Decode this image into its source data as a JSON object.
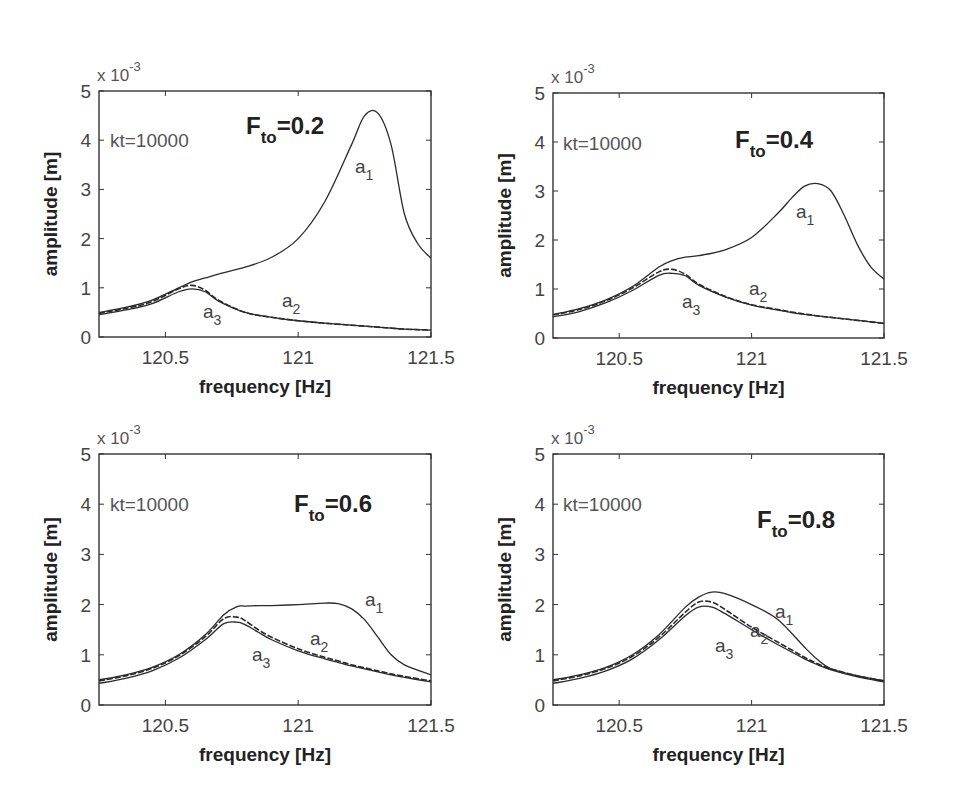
{
  "figure": {
    "layout": "2x2 grid of subplots",
    "panels": [
      {
        "id": "p1",
        "title": "F_to=0.2",
        "ft_main": "F",
        "ft_sub": "to",
        "ft_value": "=0.2",
        "annotation": "kt=10000",
        "exponent_label": "x 10",
        "exponent_power": "-3",
        "xlabel": "frequency  [Hz]",
        "ylabel": "amplitude [m]",
        "frame": {
          "left": 99,
          "top": 91,
          "right": 431,
          "bottom": 337
        },
        "ft_pos": [
          246,
          134
        ],
        "kt_pos": [
          110,
          147
        ],
        "labels": [
          {
            "base": "a",
            "sub": "1",
            "x": 355,
            "y": 173
          },
          {
            "base": "a",
            "sub": "2",
            "x": 282,
            "y": 307
          },
          {
            "base": "a",
            "sub": "3",
            "x": 203,
            "y": 318
          }
        ]
      },
      {
        "id": "p2",
        "title": "F_to=0.4",
        "ft_main": "F",
        "ft_sub": "to",
        "ft_value": "=0.4",
        "annotation": "kt=10000",
        "exponent_label": "x 10",
        "exponent_power": "-3",
        "xlabel": "frequency  [Hz]",
        "ylabel": "amplitude [m]",
        "frame": {
          "left": 553,
          "top": 93,
          "right": 884,
          "bottom": 338
        },
        "ft_pos": [
          735,
          148
        ],
        "kt_pos": [
          563,
          150
        ],
        "labels": [
          {
            "base": "a",
            "sub": "1",
            "x": 796,
            "y": 218
          },
          {
            "base": "a",
            "sub": "2",
            "x": 749,
            "y": 295
          },
          {
            "base": "a",
            "sub": "3",
            "x": 682,
            "y": 308
          }
        ]
      },
      {
        "id": "p3",
        "title": "F_to=0.6",
        "ft_main": "F",
        "ft_sub": "to",
        "ft_value": "=0.6",
        "annotation": "kt=10000",
        "exponent_label": "x 10",
        "exponent_power": "-3",
        "xlabel": "frequency  [Hz]",
        "ylabel": "amplitude [m]",
        "frame": {
          "left": 99,
          "top": 454,
          "right": 431,
          "bottom": 705
        },
        "ft_pos": [
          294,
          512
        ],
        "kt_pos": [
          110,
          511
        ],
        "labels": [
          {
            "base": "a",
            "sub": "1",
            "x": 365,
            "y": 606
          },
          {
            "base": "a",
            "sub": "2",
            "x": 310,
            "y": 645
          },
          {
            "base": "a",
            "sub": "3",
            "x": 252,
            "y": 661
          }
        ]
      },
      {
        "id": "p4",
        "title": "F_to=0.8",
        "ft_main": "F",
        "ft_sub": "to",
        "ft_value": "=0.8",
        "annotation": "kt=10000",
        "exponent_label": "x 10",
        "exponent_power": "-3",
        "xlabel": "frequency  [Hz]",
        "ylabel": "amplitude [m]",
        "frame": {
          "left": 553,
          "top": 454,
          "right": 884,
          "bottom": 705
        },
        "ft_pos": [
          757,
          528
        ],
        "kt_pos": [
          563,
          511
        ],
        "labels": [
          {
            "base": "a",
            "sub": "1",
            "x": 775,
            "y": 618
          },
          {
            "base": "a",
            "sub": "2",
            "x": 750,
            "y": 637
          },
          {
            "base": "a",
            "sub": "3",
            "x": 715,
            "y": 652
          }
        ]
      }
    ]
  },
  "chart_data": [
    {
      "type": "line",
      "title": "F_to=0.2",
      "annotation": "kt=10000",
      "xlabel": "frequency [Hz]",
      "ylabel": "amplitude [m]",
      "y_scale": "x 10^-3",
      "xlim": [
        120.25,
        121.5
      ],
      "ylim": [
        0,
        5
      ],
      "xticks": [
        120.5,
        121,
        121.5
      ],
      "yticks": [
        0,
        1,
        2,
        3,
        4,
        5
      ],
      "grid": false,
      "x": [
        120.25,
        120.35,
        120.45,
        120.55,
        120.6,
        120.65,
        120.7,
        120.8,
        120.9,
        121.0,
        121.1,
        121.2,
        121.25,
        121.3,
        121.35,
        121.4,
        121.45,
        121.5
      ],
      "series": [
        {
          "name": "a1",
          "style": "solid",
          "values": [
            0.5,
            0.6,
            0.75,
            1.0,
            1.12,
            1.2,
            1.28,
            1.42,
            1.62,
            2.0,
            2.75,
            3.9,
            4.5,
            4.55,
            3.9,
            2.5,
            1.9,
            1.6
          ]
        },
        {
          "name": "a2",
          "style": "dashed",
          "values": [
            0.48,
            0.58,
            0.72,
            0.98,
            1.05,
            0.95,
            0.75,
            0.5,
            0.4,
            0.33,
            0.28,
            0.24,
            0.22,
            0.2,
            0.18,
            0.16,
            0.15,
            0.14
          ]
        },
        {
          "name": "a3",
          "style": "solid",
          "values": [
            0.45,
            0.55,
            0.68,
            0.92,
            0.98,
            0.92,
            0.73,
            0.5,
            0.4,
            0.33,
            0.28,
            0.24,
            0.22,
            0.2,
            0.18,
            0.16,
            0.15,
            0.14
          ]
        }
      ]
    },
    {
      "type": "line",
      "title": "F_to=0.4",
      "annotation": "kt=10000",
      "xlabel": "frequency [Hz]",
      "ylabel": "amplitude [m]",
      "y_scale": "x 10^-3",
      "xlim": [
        120.25,
        121.5
      ],
      "ylim": [
        0,
        5
      ],
      "xticks": [
        120.5,
        121,
        121.5
      ],
      "yticks": [
        0,
        1,
        2,
        3,
        4,
        5
      ],
      "grid": false,
      "x": [
        120.25,
        120.35,
        120.45,
        120.55,
        120.65,
        120.7,
        120.75,
        120.8,
        120.9,
        121.0,
        121.1,
        121.15,
        121.2,
        121.25,
        121.3,
        121.35,
        121.4,
        121.45,
        121.5
      ],
      "series": [
        {
          "name": "a1",
          "style": "solid",
          "values": [
            0.48,
            0.6,
            0.78,
            1.05,
            1.45,
            1.58,
            1.65,
            1.68,
            1.8,
            2.05,
            2.55,
            2.85,
            3.1,
            3.15,
            3.0,
            2.5,
            1.9,
            1.45,
            1.2
          ]
        },
        {
          "name": "a2",
          "style": "dashed",
          "values": [
            0.47,
            0.58,
            0.76,
            1.02,
            1.35,
            1.4,
            1.3,
            1.1,
            0.85,
            0.68,
            0.58,
            0.53,
            0.49,
            0.45,
            0.42,
            0.39,
            0.36,
            0.33,
            0.3
          ]
        },
        {
          "name": "a3",
          "style": "solid",
          "values": [
            0.43,
            0.54,
            0.72,
            0.97,
            1.28,
            1.32,
            1.27,
            1.08,
            0.84,
            0.67,
            0.57,
            0.52,
            0.48,
            0.45,
            0.42,
            0.39,
            0.36,
            0.33,
            0.3
          ]
        }
      ]
    },
    {
      "type": "line",
      "title": "F_to=0.6",
      "annotation": "kt=10000",
      "xlabel": "frequency [Hz]",
      "ylabel": "amplitude [m]",
      "y_scale": "x 10^-3",
      "xlim": [
        120.25,
        121.5
      ],
      "ylim": [
        0,
        5
      ],
      "xticks": [
        120.5,
        121,
        121.5
      ],
      "yticks": [
        0,
        1,
        2,
        3,
        4,
        5
      ],
      "grid": false,
      "x": [
        120.25,
        120.35,
        120.45,
        120.55,
        120.65,
        120.72,
        120.77,
        120.8,
        120.85,
        120.9,
        121.0,
        121.1,
        121.15,
        121.2,
        121.25,
        121.3,
        121.35,
        121.4,
        121.5
      ],
      "series": [
        {
          "name": "a1",
          "style": "solid",
          "values": [
            0.5,
            0.6,
            0.75,
            1.0,
            1.4,
            1.8,
            1.96,
            1.97,
            1.98,
            1.98,
            2.0,
            2.03,
            2.02,
            1.92,
            1.7,
            1.35,
            1.0,
            0.8,
            0.6
          ]
        },
        {
          "name": "a2",
          "style": "dashed",
          "values": [
            0.48,
            0.58,
            0.73,
            0.98,
            1.36,
            1.72,
            1.75,
            1.68,
            1.5,
            1.35,
            1.12,
            0.95,
            0.88,
            0.8,
            0.74,
            0.68,
            0.62,
            0.57,
            0.48
          ]
        },
        {
          "name": "a3",
          "style": "solid",
          "values": [
            0.43,
            0.53,
            0.68,
            0.93,
            1.3,
            1.62,
            1.65,
            1.6,
            1.45,
            1.3,
            1.08,
            0.92,
            0.85,
            0.78,
            0.72,
            0.66,
            0.6,
            0.55,
            0.46
          ]
        }
      ]
    },
    {
      "type": "line",
      "title": "F_to=0.8",
      "annotation": "kt=10000",
      "xlabel": "frequency [Hz]",
      "ylabel": "amplitude [m]",
      "y_scale": "x 10^-3",
      "xlim": [
        120.25,
        121.5
      ],
      "ylim": [
        0,
        5
      ],
      "xticks": [
        120.5,
        121,
        121.5
      ],
      "yticks": [
        0,
        1,
        2,
        3,
        4,
        5
      ],
      "grid": false,
      "x": [
        120.25,
        120.35,
        120.45,
        120.55,
        120.65,
        120.75,
        120.8,
        120.85,
        120.9,
        121.0,
        121.1,
        121.2,
        121.25,
        121.3,
        121.4,
        121.5
      ],
      "series": [
        {
          "name": "a1",
          "style": "solid",
          "values": [
            0.5,
            0.6,
            0.75,
            1.0,
            1.4,
            1.95,
            2.15,
            2.25,
            2.22,
            2.0,
            1.7,
            1.15,
            0.9,
            0.72,
            0.58,
            0.48
          ]
        },
        {
          "name": "a2",
          "style": "dashed",
          "values": [
            0.48,
            0.58,
            0.73,
            0.97,
            1.35,
            1.85,
            2.05,
            2.05,
            1.9,
            1.55,
            1.25,
            0.95,
            0.82,
            0.72,
            0.58,
            0.48
          ]
        },
        {
          "name": "a3",
          "style": "solid",
          "values": [
            0.43,
            0.53,
            0.68,
            0.92,
            1.3,
            1.78,
            1.95,
            1.95,
            1.82,
            1.5,
            1.2,
            0.92,
            0.8,
            0.7,
            0.56,
            0.46
          ]
        }
      ]
    }
  ]
}
